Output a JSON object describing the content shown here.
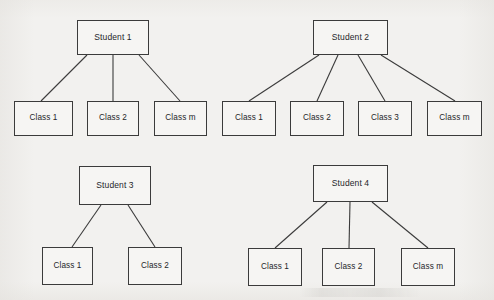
{
  "figure": {
    "type": "tree-diagram",
    "background_color": "#f2f1ef",
    "stroke_color": "#3b3b3b",
    "node_fill_color": "#f6f5f3",
    "text_color": "#25262a"
  },
  "trees": [
    {
      "id": "student-1",
      "root": {
        "label": "Student 1",
        "x": 77,
        "y": 20,
        "w": 72,
        "h": 35
      },
      "children": [
        {
          "label": "Class 1",
          "x": 14,
          "y": 101,
          "w": 59,
          "h": 35
        },
        {
          "label": "Class 2",
          "x": 87,
          "y": 101,
          "w": 52,
          "h": 35
        },
        {
          "label": "Class m",
          "x": 154,
          "y": 101,
          "w": 53,
          "h": 35
        }
      ],
      "edges": [
        {
          "x1": 87,
          "y1": 55,
          "x2": 41,
          "y2": 101
        },
        {
          "x1": 113,
          "y1": 55,
          "x2": 113,
          "y2": 101
        },
        {
          "x1": 139,
          "y1": 55,
          "x2": 180,
          "y2": 101
        }
      ]
    },
    {
      "id": "student-2",
      "root": {
        "label": "Student 2",
        "x": 313,
        "y": 20,
        "w": 75,
        "h": 35
      },
      "children": [
        {
          "label": "Class 1",
          "x": 222,
          "y": 101,
          "w": 54,
          "h": 35
        },
        {
          "label": "Class 2",
          "x": 290,
          "y": 101,
          "w": 54,
          "h": 35
        },
        {
          "label": "Class 3",
          "x": 358,
          "y": 101,
          "w": 54,
          "h": 35
        },
        {
          "label": "Class m",
          "x": 427,
          "y": 101,
          "w": 55,
          "h": 35
        }
      ],
      "edges": [
        {
          "x1": 319,
          "y1": 55,
          "x2": 249,
          "y2": 101
        },
        {
          "x1": 338,
          "y1": 55,
          "x2": 317,
          "y2": 101
        },
        {
          "x1": 358,
          "y1": 55,
          "x2": 385,
          "y2": 101
        },
        {
          "x1": 381,
          "y1": 55,
          "x2": 455,
          "y2": 101
        }
      ]
    },
    {
      "id": "student-3",
      "root": {
        "label": "Student 3",
        "x": 79,
        "y": 166,
        "w": 72,
        "h": 39
      },
      "children": [
        {
          "label": "Class 1",
          "x": 42,
          "y": 247,
          "w": 51,
          "h": 38
        },
        {
          "label": "Class 2",
          "x": 128,
          "y": 247,
          "w": 54,
          "h": 38
        }
      ],
      "edges": [
        {
          "x1": 101,
          "y1": 205,
          "x2": 72,
          "y2": 247
        },
        {
          "x1": 128,
          "y1": 205,
          "x2": 155,
          "y2": 247
        }
      ]
    },
    {
      "id": "student-4",
      "root": {
        "label": "Student 4",
        "x": 313,
        "y": 165,
        "w": 75,
        "h": 37
      },
      "children": [
        {
          "label": "Class 1",
          "x": 248,
          "y": 248,
          "w": 54,
          "h": 38
        },
        {
          "label": "Class 2",
          "x": 322,
          "y": 248,
          "w": 53,
          "h": 38
        },
        {
          "label": "Class m",
          "x": 401,
          "y": 248,
          "w": 54,
          "h": 38
        }
      ],
      "edges": [
        {
          "x1": 327,
          "y1": 202,
          "x2": 275,
          "y2": 248
        },
        {
          "x1": 350,
          "y1": 202,
          "x2": 349,
          "y2": 248
        },
        {
          "x1": 372,
          "y1": 202,
          "x2": 428,
          "y2": 248
        }
      ]
    }
  ]
}
